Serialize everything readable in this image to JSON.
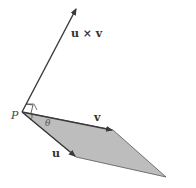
{
  "diagram": {
    "labels": {
      "cross": "u × v",
      "v": "v",
      "u": "u",
      "point": "P",
      "angle": "θ"
    },
    "colors": {
      "fill": "#bdbdbd",
      "stroke": "#3a3a3a",
      "background": "#ffffff"
    },
    "points": {
      "P": [
        22,
        112
      ],
      "cross_tip": [
        76,
        8
      ],
      "v_end": [
        113,
        130
      ],
      "u_end": [
        76,
        157
      ],
      "far_corner": [
        166,
        177
      ]
    }
  }
}
